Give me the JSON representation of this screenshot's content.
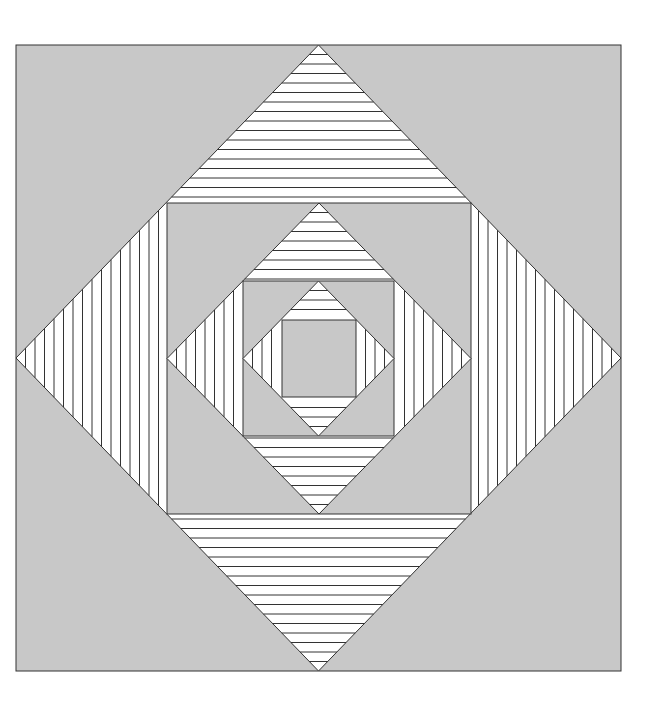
{
  "colors": {
    "background": "#ffffff",
    "fill_gray": "#c8c8c8",
    "fill_white": "#ffffff",
    "stroke": "#333333"
  },
  "figure": {
    "hatch_spacing": 9.5,
    "center": [
      319,
      358
    ],
    "levels": [
      {
        "square": [
          16,
          45,
          621,
          671
        ],
        "inner_square": [
          167,
          203,
          471,
          514
        ]
      },
      {
        "square": [
          167,
          203,
          471,
          514
        ],
        "inner_square": [
          243,
          281,
          394,
          436
        ]
      },
      {
        "square": [
          243,
          281,
          394,
          436
        ],
        "inner_square": [
          282,
          320,
          356,
          397
        ]
      }
    ]
  }
}
